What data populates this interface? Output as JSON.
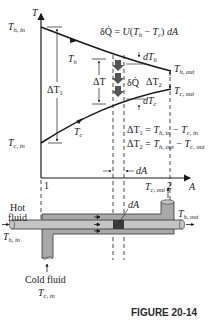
{
  "figure": {
    "caption": "FIGURE 20-14",
    "equation_top": "δQ̇ = U(T_h − T_c) dA",
    "axis": {
      "y_label": "T",
      "x_label": "A",
      "x_tick_1": "1",
      "x_tick_2": "2"
    },
    "labels": {
      "T_h_in": "T_h,in",
      "T_c_in": "T_c,in",
      "T_h_out": "T_h,out",
      "T_c_out": "T_c,out",
      "T_h": "T_h",
      "T_c": "T_c",
      "delta_T1": "ΔT_1",
      "delta_T": "ΔT",
      "delta_T2": "ΔT_2",
      "dT_h": "dT_h",
      "dT_c": "dT_c",
      "delta_Q": "δQ̇",
      "dA_axis": "dA",
      "dA_exchanger": "dA",
      "eq1": "ΔT_1 = T_h,in − T_c,in",
      "eq2": "ΔT_2 = T_h,out − T_c,out"
    },
    "exchanger": {
      "hot_fluid_label": "Hot fluid",
      "cold_fluid_label": "Cold fluid",
      "hot_inlet": "T_h,in",
      "hot_outlet": "T_h,out",
      "cold_inlet": "T_c,in",
      "cold_outlet": "T_c,out"
    },
    "colors": {
      "line": "#1a1a1a",
      "shell_fill": "#a9a9a9",
      "tube_fill": "#c4c4c4",
      "element_fill": "#3a3a3a",
      "heat_arrow": "#555555"
    }
  }
}
